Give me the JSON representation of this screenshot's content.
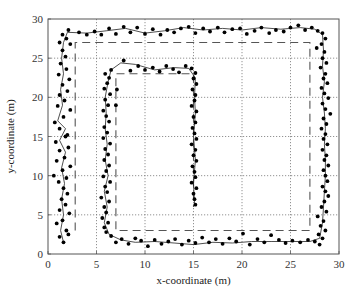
{
  "chart_data": {
    "type": "scatter",
    "title": "",
    "xlabel": "x-coordinate (m)",
    "ylabel": "y-coordinate (m)",
    "xlim": [
      0,
      30
    ],
    "ylim": [
      0,
      30
    ],
    "xticks": [
      0,
      5,
      10,
      15,
      20,
      25,
      30
    ],
    "yticks": [
      0,
      5,
      10,
      15,
      20,
      25,
      30
    ],
    "grid": true,
    "legend": null,
    "series": [
      {
        "name": "reference-path",
        "style": "dashed",
        "color": "#555555",
        "points": [
          [
            2.8,
            3
          ],
          [
            2.8,
            27
          ],
          [
            27,
            27
          ],
          [
            27,
            3
          ],
          [
            7,
            3
          ],
          [
            7,
            23
          ],
          [
            15,
            23
          ],
          [
            15,
            6
          ]
        ]
      },
      {
        "name": "estimated-track",
        "style": "solid",
        "color": "#222222",
        "points": [
          [
            1.6,
            1.5
          ],
          [
            1.3,
            3
          ],
          [
            1.6,
            5
          ],
          [
            1.4,
            7
          ],
          [
            1.7,
            9
          ],
          [
            1.4,
            11
          ],
          [
            1.8,
            13
          ],
          [
            1.2,
            14.5
          ],
          [
            1.8,
            16
          ],
          [
            1.0,
            17
          ],
          [
            1.5,
            19
          ],
          [
            1.3,
            21
          ],
          [
            1.6,
            23
          ],
          [
            1.4,
            25
          ],
          [
            1.6,
            27
          ],
          [
            2.0,
            28.3
          ],
          [
            4,
            28.2
          ],
          [
            6,
            28.5
          ],
          [
            8,
            28.8
          ],
          [
            10,
            28.2
          ],
          [
            12,
            28.5
          ],
          [
            14,
            28.9
          ],
          [
            16,
            28.6
          ],
          [
            18,
            28.8
          ],
          [
            20,
            28.6
          ],
          [
            22,
            28.9
          ],
          [
            24,
            28.7
          ],
          [
            26,
            28.9
          ],
          [
            27.5,
            28.7
          ],
          [
            28.3,
            28.0
          ],
          [
            28.4,
            26
          ],
          [
            28.3,
            24
          ],
          [
            28.5,
            22
          ],
          [
            28.3,
            20
          ],
          [
            28.5,
            18
          ],
          [
            28.6,
            16
          ],
          [
            28.5,
            14
          ],
          [
            28.6,
            12
          ],
          [
            28.6,
            10
          ],
          [
            28.5,
            8
          ],
          [
            28.4,
            6
          ],
          [
            28.3,
            4
          ],
          [
            28.0,
            2
          ],
          [
            27,
            1.6
          ],
          [
            25,
            1.6
          ],
          [
            23,
            1.6
          ],
          [
            21,
            1.6
          ],
          [
            19,
            1.4
          ],
          [
            17,
            1.5
          ],
          [
            15,
            1.2
          ],
          [
            13,
            1.4
          ],
          [
            11,
            1.6
          ],
          [
            9,
            1.5
          ],
          [
            7.5,
            1.8
          ],
          [
            6.3,
            2.5
          ],
          [
            5.8,
            4
          ],
          [
            6.1,
            6
          ],
          [
            5.8,
            8
          ],
          [
            6.2,
            10
          ],
          [
            5.9,
            12
          ],
          [
            6.1,
            14
          ],
          [
            5.9,
            16
          ],
          [
            6.0,
            18
          ],
          [
            5.9,
            20
          ],
          [
            6.2,
            22
          ],
          [
            6.5,
            23.5
          ],
          [
            7.5,
            24.4
          ],
          [
            9,
            24.2
          ],
          [
            11,
            23.5
          ],
          [
            13,
            23.8
          ],
          [
            14.5,
            23.7
          ],
          [
            15.2,
            22.5
          ],
          [
            15.1,
            20
          ],
          [
            15.2,
            18
          ],
          [
            15.0,
            15
          ],
          [
            15.2,
            12
          ],
          [
            15.0,
            9
          ],
          [
            15.1,
            6.5
          ]
        ]
      },
      {
        "name": "measurements",
        "style": "markers",
        "color": "#000000",
        "points": [
          [
            1.6,
            1.5
          ],
          [
            1.2,
            2.2
          ],
          [
            2.1,
            2.5
          ],
          [
            1.9,
            3.0
          ],
          [
            0.9,
            3.9
          ],
          [
            1.5,
            4.3
          ],
          [
            2.2,
            5.2
          ],
          [
            1.2,
            5.6
          ],
          [
            1.8,
            6.3
          ],
          [
            1.4,
            7.0
          ],
          [
            2.0,
            7.7
          ],
          [
            1.6,
            8.4
          ],
          [
            1.1,
            9.2
          ],
          [
            1.9,
            9.7
          ],
          [
            0.6,
            10.0
          ],
          [
            1.5,
            10.7
          ],
          [
            2.3,
            11.2
          ],
          [
            0.9,
            11.9
          ],
          [
            1.7,
            12.3
          ],
          [
            1.2,
            13.2
          ],
          [
            2.1,
            13.6
          ],
          [
            0.8,
            14.3
          ],
          [
            1.8,
            15.0
          ],
          [
            2.0,
            15.2
          ],
          [
            1.2,
            16.0
          ],
          [
            0.7,
            16.8
          ],
          [
            1.6,
            17.5
          ],
          [
            2.3,
            18.4
          ],
          [
            1.0,
            18.9
          ],
          [
            1.7,
            19.6
          ],
          [
            1.2,
            20.3
          ],
          [
            2.0,
            20.8
          ],
          [
            1.5,
            21.6
          ],
          [
            2.2,
            22.3
          ],
          [
            1.1,
            22.9
          ],
          [
            1.9,
            23.6
          ],
          [
            1.3,
            24.3
          ],
          [
            1.8,
            25.2
          ],
          [
            1.5,
            26.0
          ],
          [
            2.3,
            26.8
          ],
          [
            1.2,
            27.0
          ],
          [
            1.9,
            27.5
          ],
          [
            1.5,
            28.0
          ],
          [
            2.1,
            28.6
          ],
          [
            3.2,
            28.3
          ],
          [
            4.0,
            28.0
          ],
          [
            4.8,
            28.4
          ],
          [
            5.5,
            28.0
          ],
          [
            6.3,
            28.8
          ],
          [
            7.0,
            28.1
          ],
          [
            7.8,
            29.0
          ],
          [
            8.5,
            28.3
          ],
          [
            9.2,
            28.9
          ],
          [
            10.0,
            28.1
          ],
          [
            10.8,
            28.7
          ],
          [
            11.6,
            28.0
          ],
          [
            12.3,
            28.6
          ],
          [
            13.0,
            28.3
          ],
          [
            13.7,
            28.8
          ],
          [
            14.5,
            29.0
          ],
          [
            15.2,
            28.2
          ],
          [
            16.0,
            28.8
          ],
          [
            16.7,
            28.4
          ],
          [
            17.5,
            28.9
          ],
          [
            18.2,
            28.3
          ],
          [
            19.0,
            28.7
          ],
          [
            19.8,
            28.8
          ],
          [
            20.5,
            28.1
          ],
          [
            21.3,
            28.5
          ],
          [
            22.0,
            28.9
          ],
          [
            22.8,
            28.2
          ],
          [
            23.5,
            28.6
          ],
          [
            24.3,
            28.4
          ],
          [
            25.0,
            28.9
          ],
          [
            25.8,
            29.2
          ],
          [
            26.5,
            28.6
          ],
          [
            27.2,
            28.9
          ],
          [
            27.8,
            28.5
          ],
          [
            28.3,
            28.2
          ],
          [
            28.6,
            27.5
          ],
          [
            28.2,
            26.8
          ],
          [
            27.7,
            26.3
          ],
          [
            28.5,
            25.8
          ],
          [
            28.3,
            25.0
          ],
          [
            28.7,
            24.4
          ],
          [
            28.1,
            23.8
          ],
          [
            28.6,
            23.0
          ],
          [
            28.4,
            22.4
          ],
          [
            28.8,
            21.8
          ],
          [
            28.2,
            21.2
          ],
          [
            28.5,
            20.5
          ],
          [
            28.9,
            19.9
          ],
          [
            28.3,
            19.2
          ],
          [
            28.6,
            18.5
          ],
          [
            29.1,
            17.9
          ],
          [
            28.4,
            17.3
          ],
          [
            28.7,
            16.6
          ],
          [
            28.2,
            16.0
          ],
          [
            28.6,
            15.3
          ],
          [
            28.4,
            14.7
          ],
          [
            28.8,
            14.0
          ],
          [
            28.3,
            13.3
          ],
          [
            28.7,
            12.6
          ],
          [
            28.5,
            12.0
          ],
          [
            28.9,
            11.3
          ],
          [
            28.4,
            10.7
          ],
          [
            28.6,
            10.0
          ],
          [
            28.8,
            9.3
          ],
          [
            28.3,
            8.6
          ],
          [
            28.6,
            8.0
          ],
          [
            28.9,
            7.4
          ],
          [
            28.5,
            6.7
          ],
          [
            28.2,
            6.0
          ],
          [
            28.7,
            5.4
          ],
          [
            27.8,
            4.8
          ],
          [
            28.4,
            4.2
          ],
          [
            28.1,
            3.6
          ],
          [
            28.6,
            3.0
          ],
          [
            27.9,
            2.5
          ],
          [
            28.3,
            2.0
          ],
          [
            27.5,
            1.6
          ],
          [
            28.0,
            1.2
          ],
          [
            26.8,
            1.8
          ],
          [
            26.0,
            1.5
          ],
          [
            25.2,
            1.7
          ],
          [
            24.5,
            1.4
          ],
          [
            23.8,
            1.8
          ],
          [
            23.0,
            2.4
          ],
          [
            22.3,
            1.5
          ],
          [
            21.6,
            1.9
          ],
          [
            20.8,
            1.2
          ],
          [
            20.1,
            2.6
          ],
          [
            19.4,
            1.6
          ],
          [
            18.7,
            2.0
          ],
          [
            18.0,
            1.3
          ],
          [
            17.3,
            1.9
          ],
          [
            16.6,
            1.5
          ],
          [
            15.9,
            2.1
          ],
          [
            15.2,
            1.4
          ],
          [
            14.5,
            1.7
          ],
          [
            13.8,
            1.2
          ],
          [
            13.1,
            1.9
          ],
          [
            12.4,
            1.6
          ],
          [
            11.7,
            1.3
          ],
          [
            11.0,
            1.8
          ],
          [
            10.3,
            1.0
          ],
          [
            9.6,
            1.7
          ],
          [
            9.0,
            2.0
          ],
          [
            8.3,
            1.3
          ],
          [
            7.6,
            1.9
          ],
          [
            7.0,
            1.5
          ],
          [
            6.5,
            2.3
          ],
          [
            6.0,
            2.8
          ],
          [
            5.8,
            3.4
          ],
          [
            6.2,
            4.0
          ],
          [
            5.6,
            4.6
          ],
          [
            6.0,
            5.3
          ],
          [
            5.8,
            6.0
          ],
          [
            6.3,
            6.7
          ],
          [
            5.5,
            7.2
          ],
          [
            6.1,
            7.9
          ],
          [
            5.9,
            8.6
          ],
          [
            6.4,
            9.2
          ],
          [
            5.7,
            9.9
          ],
          [
            6.0,
            10.6
          ],
          [
            6.3,
            11.3
          ],
          [
            5.8,
            12.0
          ],
          [
            6.2,
            12.7
          ],
          [
            5.9,
            13.4
          ],
          [
            6.4,
            14.1
          ],
          [
            5.7,
            14.8
          ],
          [
            6.1,
            15.5
          ],
          [
            5.8,
            16.2
          ],
          [
            6.3,
            16.9
          ],
          [
            6.0,
            17.6
          ],
          [
            5.7,
            18.3
          ],
          [
            6.2,
            19.0
          ],
          [
            5.9,
            19.7
          ],
          [
            6.4,
            20.4
          ],
          [
            5.8,
            21.1
          ],
          [
            6.1,
            21.8
          ],
          [
            6.3,
            22.5
          ],
          [
            5.9,
            23.0
          ],
          [
            6.5,
            23.5
          ],
          [
            7.1,
            21.0
          ],
          [
            7.0,
            19.0
          ],
          [
            7.8,
            24.7
          ],
          [
            8.5,
            23.4
          ],
          [
            9.3,
            24.0
          ],
          [
            10.0,
            23.5
          ],
          [
            10.8,
            23.8
          ],
          [
            11.5,
            23.3
          ],
          [
            12.2,
            24.0
          ],
          [
            12.9,
            23.6
          ],
          [
            13.5,
            23.2
          ],
          [
            14.2,
            24.0
          ],
          [
            14.8,
            23.7
          ],
          [
            15.2,
            23.1
          ],
          [
            15.0,
            22.4
          ],
          [
            15.3,
            21.7
          ],
          [
            14.9,
            21.0
          ],
          [
            15.2,
            20.3
          ],
          [
            15.1,
            19.6
          ],
          [
            14.8,
            18.9
          ],
          [
            15.3,
            18.2
          ],
          [
            15.0,
            17.5
          ],
          [
            15.2,
            16.8
          ],
          [
            14.9,
            16.1
          ],
          [
            15.1,
            15.4
          ],
          [
            15.3,
            14.7
          ],
          [
            14.8,
            14.0
          ],
          [
            15.2,
            13.3
          ],
          [
            15.0,
            12.6
          ],
          [
            15.3,
            11.9
          ],
          [
            14.9,
            11.2
          ],
          [
            15.1,
            10.5
          ],
          [
            15.2,
            9.8
          ],
          [
            14.8,
            9.1
          ],
          [
            15.3,
            8.4
          ],
          [
            15.0,
            7.7
          ],
          [
            15.1,
            7.0
          ],
          [
            15.2,
            6.3
          ]
        ]
      }
    ]
  },
  "axes": {
    "x_label": "x-coordinate (m)",
    "y_label": "y-coordinate (m)"
  }
}
